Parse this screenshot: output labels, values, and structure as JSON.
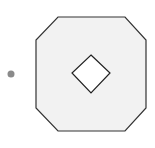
{
  "diagram": {
    "octagon": {
      "points": "58,17 125,17 146,40 146,108 125,131 58,131 36,108 36,40",
      "fill": "#f2f2f2",
      "stroke": "#333333"
    },
    "diamond": {
      "points": "91,55 110,73 91,93 72,73",
      "fill": "#ffffff",
      "stroke": "#222222"
    },
    "dot": {
      "cx": 11,
      "cy": 74,
      "r": 3.5,
      "fill": "#8a8a8a"
    }
  }
}
